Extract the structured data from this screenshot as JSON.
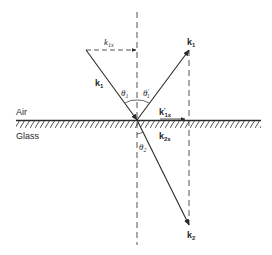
{
  "diagram": {
    "media": {
      "upper": "Air",
      "lower": "Glass"
    },
    "vectors": {
      "incident": {
        "label": "k",
        "sub": "1"
      },
      "reflected": {
        "label": "k",
        "sub": "1"
      },
      "refracted": {
        "label": "k",
        "sub": "2"
      },
      "incident_x": {
        "label": "k",
        "sub": "1x"
      },
      "reflected_x": {
        "label": "k",
        "prime": "′",
        "sub": "1x"
      },
      "refracted_x": {
        "label": "k",
        "sub": "2x"
      }
    },
    "angles": {
      "incidence": {
        "label": "θ",
        "sub": "1"
      },
      "reflection": {
        "label": "θ",
        "prime": "′",
        "sub": "1"
      },
      "refraction": {
        "label": "θ",
        "sub": "2"
      }
    },
    "colors": {
      "ink": "#2a2a2a",
      "background": "#ffffff"
    }
  }
}
